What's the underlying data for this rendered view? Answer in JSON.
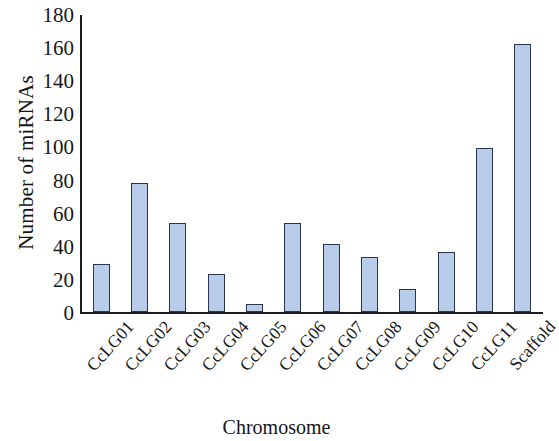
{
  "chart_data": {
    "type": "bar",
    "title": "",
    "xlabel": "Chromosome",
    "ylabel": "Number of miRNAs",
    "categories": [
      "CcLG01",
      "CcLG02",
      "CcLG03",
      "CcLG04",
      "CcLG05",
      "CcLG06",
      "CcLG07",
      "CcLG08",
      "CcLG09",
      "CcLG10",
      "CcLG11",
      "Scaffold"
    ],
    "values": [
      29,
      78,
      54,
      23,
      5,
      54,
      41,
      33,
      14,
      36,
      99,
      162
    ],
    "ylim": [
      0,
      180
    ],
    "ytick_labels": [
      "180",
      "160",
      "140",
      "120",
      "100",
      "80",
      "60",
      "40",
      "20",
      "0"
    ],
    "ytick_values": [
      180,
      160,
      140,
      120,
      100,
      80,
      60,
      40,
      20,
      0
    ],
    "ytick_step": 20,
    "grid": false,
    "legend": false,
    "bar_fill_color": "#b7cdea",
    "bar_border_color": "#2b3550",
    "axis_color": "#1c1c1c",
    "background_color": "#ffffff"
  }
}
